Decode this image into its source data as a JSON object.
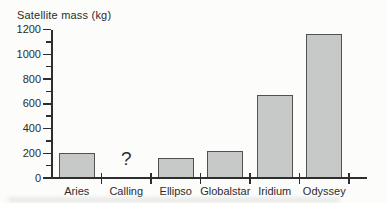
{
  "figure": {
    "title": "Satellite mass (kg)"
  },
  "chart_data": {
    "type": "bar",
    "title": "Satellite mass (kg)",
    "ylabel": "Satellite mass (kg)",
    "xlabel": "",
    "categories": [
      "Aries",
      "Calling",
      "Ellipso",
      "Globalstar",
      "Iridium",
      "Odyssey"
    ],
    "values": [
      200,
      null,
      160,
      220,
      670,
      1160
    ],
    "missing_category": "Calling",
    "missing_marker": "?",
    "ylim": [
      0,
      1200
    ],
    "yticks": [
      0,
      200,
      400,
      600,
      800,
      1000,
      1200
    ],
    "minor_tick_step": 100,
    "grid": "off",
    "legend": "none",
    "bar_color": "#c6c9c7",
    "bar_border_color": "#515151",
    "axis_color": "#2e2e2e"
  }
}
